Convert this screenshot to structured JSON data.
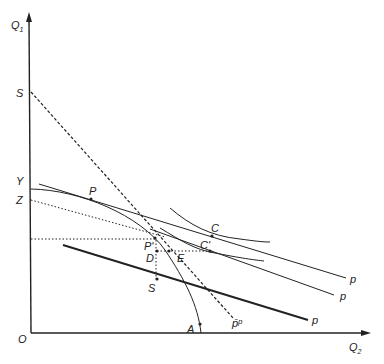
{
  "diagram": {
    "type": "economics-production-possibility",
    "axes": {
      "y_label_main": "Q",
      "y_label_sub": "1",
      "x_label_main": "Q",
      "x_label_sub": "2",
      "origin_label": "O"
    },
    "axis_labels": {
      "s_top": "S",
      "y": "Y",
      "z": "Z"
    },
    "points": {
      "p": "P",
      "p_prime": "P'",
      "d": "D",
      "e": "E",
      "s_low": "S",
      "c": "C",
      "c_prime": "C'",
      "a": "A",
      "p_bar": "p̄ᵖ"
    },
    "price_lines": [
      "p",
      "p",
      "p"
    ]
  }
}
